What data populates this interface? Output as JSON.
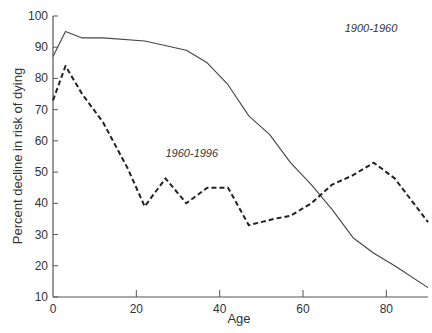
{
  "chart_data": {
    "type": "line",
    "title": "",
    "xlabel": "Age",
    "ylabel": "Percent decline in risk of dying",
    "xlim": [
      0,
      90
    ],
    "ylim": [
      10,
      100
    ],
    "x_ticks": [
      0,
      20,
      40,
      60,
      80
    ],
    "y_ticks": [
      10,
      20,
      30,
      40,
      50,
      60,
      70,
      80,
      90,
      100
    ],
    "grid": false,
    "legend": "inline labels",
    "series": [
      {
        "name": "1900-1960",
        "style": "solid",
        "color": "#444444",
        "label_pos": {
          "x": 70,
          "y": 95
        },
        "x": [
          0,
          3,
          7,
          12,
          22,
          32,
          37,
          42,
          47,
          52,
          57,
          62,
          67,
          72,
          77,
          82,
          90
        ],
        "values": [
          87,
          95,
          93,
          93,
          92,
          89,
          85,
          78,
          68,
          62,
          53,
          46,
          38,
          29,
          24,
          20,
          13
        ]
      },
      {
        "name": "1960-1996",
        "style": "dashed",
        "color": "#222222",
        "label_pos": {
          "x": 27,
          "y": 55
        },
        "x": [
          0,
          3,
          7,
          12,
          18,
          22,
          27,
          32,
          37,
          42,
          47,
          53,
          57,
          62,
          67,
          72,
          77,
          82,
          90
        ],
        "values": [
          73,
          84,
          75,
          66,
          51,
          39,
          48,
          40,
          45,
          45,
          33,
          35,
          36,
          40,
          46,
          49,
          53,
          48,
          34
        ]
      }
    ]
  }
}
